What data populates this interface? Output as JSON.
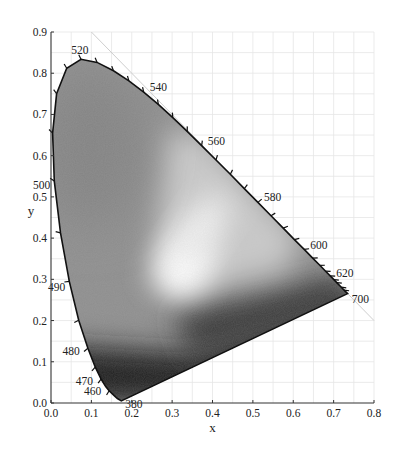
{
  "chart_data": {
    "type": "scatter",
    "title": "",
    "subtitle": "CIE 1931 chromaticity diagram (grayscale)",
    "xlabel": "x",
    "ylabel": "y",
    "xlim": [
      0.0,
      0.8
    ],
    "ylim": [
      0.0,
      0.9
    ],
    "grid": true,
    "legend": null,
    "x_ticks": [
      "0.0",
      "0.1",
      "0.2",
      "0.3",
      "0.4",
      "0.5",
      "0.6",
      "0.7",
      "0.8"
    ],
    "y_ticks": [
      "0.0",
      "0.1",
      "0.2",
      "0.3",
      "0.4",
      "0.5",
      "0.6",
      "0.7",
      "0.8",
      "0.9"
    ],
    "spectral_locus": {
      "name": "spectral locus",
      "points": [
        {
          "nm": 380,
          "x": 0.1741,
          "y": 0.005
        },
        {
          "nm": 440,
          "x": 0.1644,
          "y": 0.0109
        },
        {
          "nm": 450,
          "x": 0.1566,
          "y": 0.0177
        },
        {
          "nm": 460,
          "x": 0.144,
          "y": 0.0297
        },
        {
          "nm": 465,
          "x": 0.1355,
          "y": 0.0399
        },
        {
          "nm": 470,
          "x": 0.1241,
          "y": 0.0578
        },
        {
          "nm": 475,
          "x": 0.1096,
          "y": 0.0868
        },
        {
          "nm": 480,
          "x": 0.0913,
          "y": 0.1327
        },
        {
          "nm": 485,
          "x": 0.0687,
          "y": 0.2007
        },
        {
          "nm": 490,
          "x": 0.0454,
          "y": 0.295
        },
        {
          "nm": 495,
          "x": 0.0235,
          "y": 0.4127
        },
        {
          "nm": 500,
          "x": 0.0082,
          "y": 0.5384
        },
        {
          "nm": 505,
          "x": 0.0039,
          "y": 0.6548
        },
        {
          "nm": 510,
          "x": 0.0139,
          "y": 0.7502
        },
        {
          "nm": 515,
          "x": 0.0389,
          "y": 0.812
        },
        {
          "nm": 520,
          "x": 0.0743,
          "y": 0.8338
        },
        {
          "nm": 525,
          "x": 0.1142,
          "y": 0.8262
        },
        {
          "nm": 530,
          "x": 0.1547,
          "y": 0.8059
        },
        {
          "nm": 535,
          "x": 0.1929,
          "y": 0.7816
        },
        {
          "nm": 540,
          "x": 0.2296,
          "y": 0.7543
        },
        {
          "nm": 545,
          "x": 0.2658,
          "y": 0.7243
        },
        {
          "nm": 550,
          "x": 0.3016,
          "y": 0.6923
        },
        {
          "nm": 555,
          "x": 0.3373,
          "y": 0.6589
        },
        {
          "nm": 560,
          "x": 0.3731,
          "y": 0.6245
        },
        {
          "nm": 565,
          "x": 0.4087,
          "y": 0.5896
        },
        {
          "nm": 570,
          "x": 0.4441,
          "y": 0.5547
        },
        {
          "nm": 575,
          "x": 0.4788,
          "y": 0.5202
        },
        {
          "nm": 580,
          "x": 0.5125,
          "y": 0.4866
        },
        {
          "nm": 585,
          "x": 0.5448,
          "y": 0.4544
        },
        {
          "nm": 590,
          "x": 0.5752,
          "y": 0.4242
        },
        {
          "nm": 595,
          "x": 0.6029,
          "y": 0.3965
        },
        {
          "nm": 600,
          "x": 0.627,
          "y": 0.3725
        },
        {
          "nm": 605,
          "x": 0.6482,
          "y": 0.3514
        },
        {
          "nm": 610,
          "x": 0.6658,
          "y": 0.334
        },
        {
          "nm": 615,
          "x": 0.6801,
          "y": 0.3197
        },
        {
          "nm": 620,
          "x": 0.6915,
          "y": 0.3083
        },
        {
          "nm": 625,
          "x": 0.7006,
          "y": 0.2993
        },
        {
          "nm": 630,
          "x": 0.7079,
          "y": 0.292
        },
        {
          "nm": 640,
          "x": 0.719,
          "y": 0.2809
        },
        {
          "nm": 650,
          "x": 0.726,
          "y": 0.274
        },
        {
          "nm": 700,
          "x": 0.7347,
          "y": 0.2653
        }
      ]
    },
    "wavelength_labels": [
      {
        "text": "380",
        "nm": 380
      },
      {
        "text": "460",
        "nm": 460
      },
      {
        "text": "470",
        "nm": 470
      },
      {
        "text": "480",
        "nm": 480
      },
      {
        "text": "490",
        "nm": 490
      },
      {
        "text": "500",
        "nm": 500
      },
      {
        "text": "520",
        "nm": 520
      },
      {
        "text": "540",
        "nm": 540
      },
      {
        "text": "560",
        "nm": 560
      },
      {
        "text": "580",
        "nm": 580
      },
      {
        "text": "600",
        "nm": 600
      },
      {
        "text": "620",
        "nm": 620
      },
      {
        "text": "700",
        "nm": 700
      }
    ],
    "annotations": [
      {
        "type": "line",
        "description": "diagonal x + y = 1 reference line",
        "from": [
          0.1,
          0.9
        ],
        "to": [
          0.8,
          0.2
        ]
      },
      {
        "type": "line",
        "description": "line of purples",
        "from": [
          0.1741,
          0.005
        ],
        "to": [
          0.7347,
          0.2653
        ]
      }
    ],
    "white_point_region": {
      "x": 0.33,
      "y": 0.33
    }
  }
}
